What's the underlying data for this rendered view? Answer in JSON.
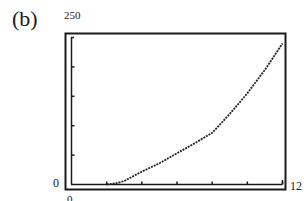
{
  "figure": {
    "panel_label": "(b)",
    "y_max_label": "250",
    "y_min_label": "0",
    "x_min_label": "0",
    "x_max_label": "12"
  },
  "chart_data": {
    "type": "line",
    "title": "",
    "panel": "(b)",
    "xlabel": "",
    "ylabel": "",
    "xlim": [
      0,
      12
    ],
    "ylim": [
      0,
      250
    ],
    "x_tick_step": 2,
    "y_tick_step": 50,
    "grid": false,
    "legend": null,
    "series": [
      {
        "name": "curve",
        "x": [
          2,
          2.5,
          3,
          4,
          5,
          6,
          7,
          8,
          9,
          10,
          11,
          12
        ],
        "y": [
          0,
          2,
          6,
          22,
          36,
          53,
          70,
          88,
          120,
          155,
          195,
          240
        ]
      }
    ],
    "style": "graphing-calculator window, dotted pixel curve, double-line frame"
  }
}
